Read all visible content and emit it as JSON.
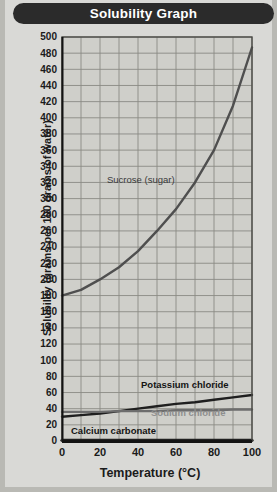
{
  "title": "Solubility Graph",
  "chart_data": {
    "type": "line",
    "title": "Solubility Graph",
    "xlabel": "Temperature (°C)",
    "ylabel": "Solubility (grams per 100 grams of water)",
    "xlim": [
      0,
      100
    ],
    "ylim": [
      0,
      500
    ],
    "xticks": [
      0,
      20,
      40,
      60,
      80,
      100
    ],
    "yticks": [
      0,
      20,
      40,
      60,
      80,
      100,
      120,
      140,
      160,
      180,
      200,
      220,
      240,
      260,
      280,
      300,
      320,
      340,
      360,
      380,
      400,
      420,
      440,
      460,
      480,
      500
    ],
    "grid": true,
    "legend_position": "inline-labels",
    "x": [
      0,
      10,
      20,
      30,
      40,
      50,
      60,
      70,
      80,
      90,
      100
    ],
    "series": [
      {
        "name": "Sucrose (sugar)",
        "label": "Sucrose (sugar)",
        "color": "#4f4f4f",
        "values": [
          180,
          187,
          200,
          215,
          235,
          260,
          287,
          320,
          360,
          415,
          487
        ]
      },
      {
        "name": "Potassium chloride",
        "label": "Potassium chloride",
        "color": "#1f1f1f",
        "values": [
          30,
          32,
          34,
          37,
          40,
          43,
          46,
          48,
          51,
          54,
          57
        ]
      },
      {
        "name": "Sodium chloride",
        "label": "Sodium chloride",
        "color": "#6d6d6d",
        "values": [
          36,
          36,
          36,
          37,
          37,
          37,
          38,
          38,
          38,
          39,
          39
        ]
      },
      {
        "name": "Calcium carbonate",
        "label": "Calcium carbonate",
        "color": "#1f1f1f",
        "values": [
          0.8,
          0.8,
          0.8,
          0.8,
          0.8,
          0.8,
          0.8,
          0.8,
          0.8,
          0.8,
          0.8
        ]
      }
    ]
  },
  "colors": {
    "banner_background": "#2b2b2b",
    "banner_text": "#ffffff",
    "card_background": "#d9d9d6",
    "plot_background": "#cfcfca",
    "grid": "#8a8a85",
    "axis": "#1f1f1f"
  }
}
